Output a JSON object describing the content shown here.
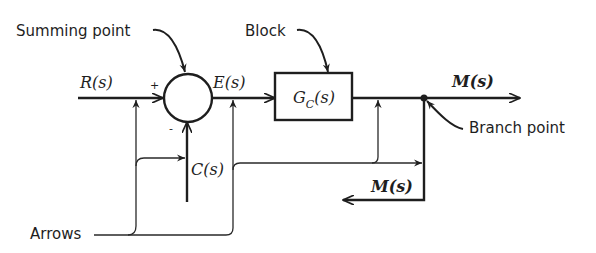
{
  "diagram": {
    "type": "block-diagram",
    "colors": {
      "line": "#1e1e1e",
      "background": "#ffffff"
    },
    "signals": {
      "input": "R(s)",
      "error": "E(s)",
      "output": "M(s)",
      "feedback": "C(s)",
      "branch_output": "M(s)"
    },
    "block": {
      "transfer_function": "G",
      "subscript": "C",
      "arg": "(s)"
    },
    "summing_signs": {
      "plus": "+",
      "minus": "-"
    },
    "annotations": {
      "summing_point": "Summing point",
      "block": "Block",
      "branch_point": "Branch point",
      "arrows": "Arrows"
    }
  }
}
